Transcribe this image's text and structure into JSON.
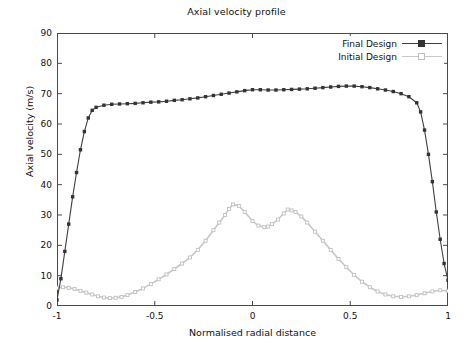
{
  "chart_data": {
    "type": "line",
    "title": "Axial velocity profile",
    "xlabel": "Normalised radial distance",
    "ylabel": "Axial velocity (m/s)",
    "xlim": [
      -1,
      1
    ],
    "ylim": [
      0,
      90
    ],
    "xticks": [
      -1,
      -0.5,
      0,
      0.5,
      1
    ],
    "xtick_labels": [
      "-1",
      "-0.5",
      "0",
      "0.5",
      "1"
    ],
    "yticks": [
      0,
      10,
      20,
      30,
      40,
      50,
      60,
      70,
      80,
      90
    ],
    "ytick_labels": [
      "0",
      "10",
      "20",
      "30",
      "40",
      "50",
      "60",
      "70",
      "80",
      "90"
    ],
    "grid": false,
    "legend_position": "top-right",
    "series": [
      {
        "name": "Final Design",
        "color": "#404040",
        "marker": "filled-square",
        "marker_color": "#333333",
        "x": [
          -1.0,
          -0.98,
          -0.96,
          -0.94,
          -0.92,
          -0.9,
          -0.88,
          -0.86,
          -0.84,
          -0.82,
          -0.8,
          -0.76,
          -0.72,
          -0.68,
          -0.64,
          -0.6,
          -0.56,
          -0.52,
          -0.48,
          -0.44,
          -0.4,
          -0.36,
          -0.32,
          -0.28,
          -0.24,
          -0.2,
          -0.16,
          -0.12,
          -0.08,
          -0.04,
          0.0,
          0.04,
          0.08,
          0.12,
          0.16,
          0.2,
          0.24,
          0.28,
          0.32,
          0.36,
          0.4,
          0.44,
          0.48,
          0.52,
          0.56,
          0.6,
          0.64,
          0.68,
          0.72,
          0.76,
          0.8,
          0.84,
          0.86,
          0.88,
          0.9,
          0.92,
          0.94,
          0.96,
          0.98,
          1.0
        ],
        "y": [
          2.0,
          9.0,
          18.0,
          27.0,
          36.0,
          44.0,
          51.5,
          57.5,
          62.0,
          64.5,
          65.5,
          66.2,
          66.5,
          66.6,
          66.7,
          66.8,
          67.0,
          67.2,
          67.3,
          67.5,
          67.8,
          68.0,
          68.3,
          68.6,
          69.0,
          69.4,
          69.8,
          70.2,
          70.6,
          71.0,
          71.3,
          71.3,
          71.2,
          71.2,
          71.3,
          71.4,
          71.5,
          71.6,
          71.8,
          72.0,
          72.2,
          72.4,
          72.5,
          72.5,
          72.3,
          72.0,
          71.6,
          71.2,
          70.7,
          70.0,
          69.0,
          67.0,
          64.0,
          58.0,
          50.0,
          41.0,
          31.0,
          22.0,
          14.0,
          8.5
        ]
      },
      {
        "name": "Initial Design",
        "color": "#c8c8c8",
        "marker": "open-square",
        "marker_color": "#c0c0c0",
        "x": [
          -1.0,
          -0.97,
          -0.94,
          -0.91,
          -0.88,
          -0.85,
          -0.82,
          -0.79,
          -0.76,
          -0.73,
          -0.7,
          -0.67,
          -0.64,
          -0.6,
          -0.56,
          -0.52,
          -0.48,
          -0.44,
          -0.4,
          -0.36,
          -0.32,
          -0.28,
          -0.24,
          -0.2,
          -0.17,
          -0.14,
          -0.12,
          -0.1,
          -0.07,
          -0.04,
          0.0,
          0.03,
          0.06,
          0.08,
          0.1,
          0.13,
          0.16,
          0.18,
          0.2,
          0.22,
          0.25,
          0.28,
          0.32,
          0.36,
          0.4,
          0.44,
          0.48,
          0.52,
          0.56,
          0.6,
          0.64,
          0.68,
          0.72,
          0.76,
          0.8,
          0.84,
          0.88,
          0.92,
          0.96,
          1.0
        ],
        "y": [
          6.0,
          6.2,
          6.0,
          5.6,
          5.0,
          4.4,
          3.8,
          3.2,
          2.8,
          2.6,
          2.7,
          3.0,
          3.6,
          4.6,
          5.8,
          7.2,
          8.8,
          10.4,
          12.2,
          14.0,
          16.0,
          18.5,
          21.5,
          25.0,
          27.5,
          30.0,
          32.0,
          33.5,
          33.0,
          31.0,
          28.0,
          26.5,
          26.0,
          26.2,
          27.0,
          28.5,
          30.5,
          31.8,
          31.5,
          31.0,
          29.5,
          27.5,
          24.5,
          21.5,
          18.5,
          15.5,
          12.8,
          10.2,
          8.0,
          6.2,
          4.8,
          3.8,
          3.2,
          3.0,
          3.2,
          3.6,
          4.2,
          4.8,
          5.2,
          5.0
        ]
      }
    ]
  },
  "legend": {
    "items": [
      {
        "label": "Final Design"
      },
      {
        "label": "Initial Design"
      }
    ]
  }
}
